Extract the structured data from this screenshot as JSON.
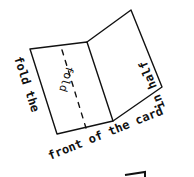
{
  "diagram": {
    "type": "hand-drawn instruction",
    "colors": {
      "ink": "#111111",
      "background": "#ffffff"
    },
    "card": {
      "left_panel": {
        "points": [
          [
            30,
            49
          ],
          [
            87,
            42
          ],
          [
            113,
            121
          ],
          [
            57,
            134
          ]
        ]
      },
      "right_panel": {
        "points": [
          [
            87,
            42
          ],
          [
            131,
            10
          ],
          [
            162,
            87
          ],
          [
            113,
            121
          ]
        ]
      },
      "fold_line": {
        "from": [
          62,
          50
        ],
        "to": [
          86,
          128
        ],
        "style": "dashed"
      }
    },
    "labels": {
      "fold_marker": "fold",
      "instruction_part1": "fold the",
      "instruction_part2": "front of the card",
      "instruction_part3": "in half"
    }
  }
}
